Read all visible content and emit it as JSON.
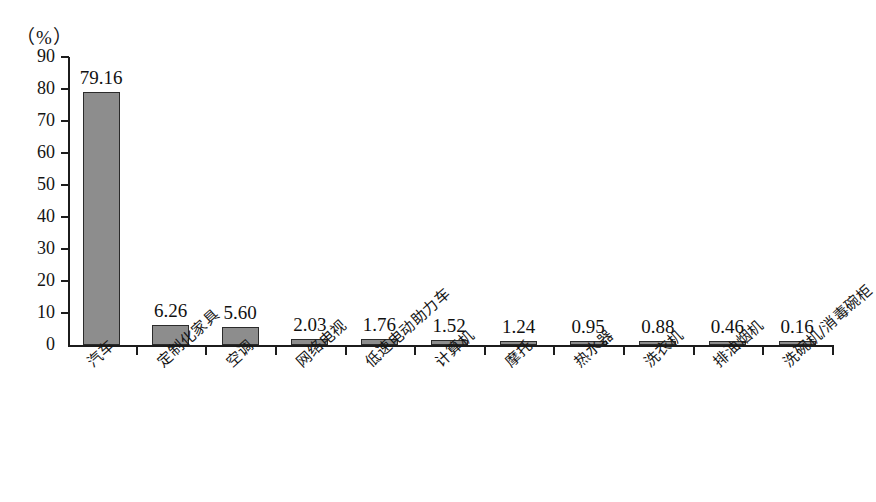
{
  "chart_data": {
    "type": "bar",
    "title": "",
    "subtitle": "",
    "xlabel": "",
    "ylabel": "",
    "unit_label": "（%）",
    "ylim": [
      0,
      90
    ],
    "ytick_step": 10,
    "yticks": [
      "90",
      "80",
      "70",
      "60",
      "50",
      "40",
      "30",
      "20",
      "10",
      "0"
    ],
    "grid": false,
    "legend": "none",
    "categories": [
      "汽车",
      "定制化家具",
      "空调",
      "网络电视",
      "低速电动助力车",
      "计算机",
      "摩托",
      "热水器",
      "洗衣机",
      "排油烟机",
      "洗碗机/消毒碗柜"
    ],
    "values": [
      79.16,
      6.26,
      5.6,
      2.03,
      1.76,
      1.52,
      1.24,
      0.95,
      0.88,
      0.46,
      0.16
    ],
    "value_labels": [
      "79.16",
      "6.26",
      "5.60",
      "2.03",
      "1.76",
      "1.52",
      "1.24",
      "0.95",
      "0.88",
      "0.46",
      "0.16"
    ],
    "bar_color": "#8d8d8d",
    "bar_border_color": "#2b2b2b",
    "axis_color": "#1c1c1c"
  }
}
